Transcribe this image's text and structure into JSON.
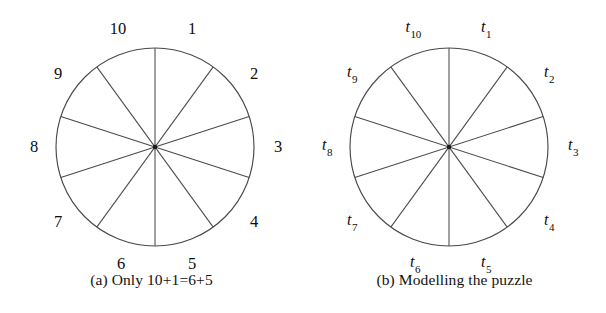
{
  "figure": {
    "panels": [
      {
        "id": "a",
        "caption": "(a) Only 10+1=6+5",
        "label_style": "plain",
        "circle": {
          "cx": 155,
          "cy": 147,
          "r": 99
        },
        "labels": [
          {
            "text": "1",
            "lx": 192,
            "ly": 29,
            "angle_deg": 72
          },
          {
            "text": "2",
            "lx": 254,
            "ly": 74,
            "angle_deg": 36
          },
          {
            "text": "3",
            "lx": 278,
            "ly": 147,
            "angle_deg": 0
          },
          {
            "text": "4",
            "lx": 254,
            "ly": 222,
            "angle_deg": -36
          },
          {
            "text": "5",
            "lx": 192,
            "ly": 264,
            "angle_deg": -72
          },
          {
            "text": "6",
            "lx": 121,
            "ly": 264,
            "angle_deg": -108
          },
          {
            "text": "7",
            "lx": 58,
            "ly": 222,
            "angle_deg": -144
          },
          {
            "text": "8",
            "lx": 34,
            "ly": 147,
            "angle_deg": 180
          },
          {
            "text": "9",
            "lx": 58,
            "ly": 74,
            "angle_deg": 144
          },
          {
            "text": "10",
            "lx": 118,
            "ly": 29,
            "angle_deg": 108
          }
        ]
      },
      {
        "id": "b",
        "caption": "(b) Modelling the puzzle",
        "label_style": "subscript",
        "circle": {
          "cx": 146,
          "cy": 147,
          "r": 99
        },
        "labels": [
          {
            "text": "t",
            "sub": "1",
            "lx": 183,
            "ly": 29,
            "angle_deg": 72
          },
          {
            "text": "t",
            "sub": "2",
            "lx": 246,
            "ly": 74,
            "angle_deg": 36
          },
          {
            "text": "t",
            "sub": "3",
            "lx": 270,
            "ly": 147,
            "angle_deg": 0
          },
          {
            "text": "t",
            "sub": "4",
            "lx": 246,
            "ly": 222,
            "angle_deg": -36
          },
          {
            "text": "t",
            "sub": "5",
            "lx": 183,
            "ly": 264,
            "angle_deg": -72
          },
          {
            "text": "t",
            "sub": "6",
            "lx": 112,
            "ly": 264,
            "angle_deg": -108
          },
          {
            "text": "t",
            "sub": "7",
            "lx": 49,
            "ly": 222,
            "angle_deg": -144
          },
          {
            "text": "t",
            "sub": "8",
            "lx": 24,
            "ly": 147,
            "angle_deg": 180
          },
          {
            "text": "t",
            "sub": "9",
            "lx": 49,
            "ly": 74,
            "angle_deg": 144
          },
          {
            "text": "t",
            "sub": "10",
            "lx": 110,
            "ly": 29,
            "angle_deg": 108
          }
        ]
      }
    ],
    "geometry": {
      "sector_count": 10,
      "diameter_count": 5,
      "diameter_angles_deg": [
        0,
        36,
        72,
        108,
        144
      ],
      "note_angle_offset_deg": 18
    },
    "colors": {
      "background": "#ffffff",
      "stroke": "#4a4a4a",
      "center_dot": "#1a1a1a",
      "text": "#0d0d0d"
    }
  }
}
